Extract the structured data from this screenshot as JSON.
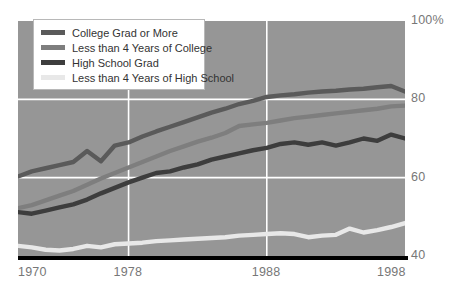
{
  "chart_data": {
    "type": "line",
    "title": "",
    "subtitle": "",
    "xlabel": "",
    "ylabel": "",
    "xlim": [
      1970,
      1998
    ],
    "ylim": [
      40,
      100
    ],
    "grid": true,
    "grid_y": [
      80,
      60
    ],
    "grid_x": [
      1978,
      1988
    ],
    "legend_position": "top-left",
    "background_color": "#969696",
    "x": [
      1970,
      1971,
      1972,
      1973,
      1974,
      1975,
      1976,
      1977,
      1978,
      1979,
      1980,
      1981,
      1982,
      1983,
      1984,
      1985,
      1986,
      1987,
      1988,
      1989,
      1990,
      1991,
      1992,
      1993,
      1994,
      1995,
      1996,
      1997,
      1998
    ],
    "series": [
      {
        "name": "College Grad or More",
        "color": "#5a5a5a",
        "values": [
          60.3,
          61.6,
          62.4,
          63.2,
          64.0,
          66.8,
          64.2,
          68.2,
          69.0,
          70.5,
          71.8,
          73.0,
          74.2,
          75.4,
          76.6,
          77.6,
          78.8,
          79.6,
          80.6,
          81.0,
          81.3,
          81.7,
          82.0,
          82.2,
          82.5,
          82.7,
          83.1,
          83.4,
          82.0
        ]
      },
      {
        "name": "Less than 4 Years of College",
        "color": "#7e7e7e",
        "values": [
          52.2,
          53.0,
          54.2,
          55.4,
          56.6,
          58.2,
          59.8,
          61.2,
          62.6,
          64.0,
          65.4,
          66.8,
          68.0,
          69.2,
          70.2,
          71.4,
          73.2,
          73.6,
          74.0,
          74.6,
          75.2,
          75.6,
          76.0,
          76.4,
          76.8,
          77.2,
          77.6,
          78.2,
          78.4
        ]
      },
      {
        "name": "High School Grad",
        "color": "#3d3d3d",
        "values": [
          51.2,
          50.8,
          51.6,
          52.4,
          53.2,
          54.4,
          56.0,
          57.4,
          58.8,
          60.0,
          61.2,
          61.6,
          62.6,
          63.4,
          64.6,
          65.4,
          66.2,
          67.0,
          67.6,
          68.6,
          69.0,
          68.4,
          69.0,
          68.2,
          69.0,
          70.0,
          69.4,
          71.0,
          70.0
        ]
      },
      {
        "name": "Less than 4 Years of High School",
        "color": "#e8e8e8",
        "values": [
          42.6,
          42.2,
          41.6,
          41.4,
          41.8,
          42.6,
          42.2,
          43.0,
          43.2,
          43.4,
          43.8,
          44.0,
          44.2,
          44.4,
          44.6,
          44.8,
          45.2,
          45.4,
          45.6,
          45.8,
          45.6,
          44.8,
          45.2,
          45.4,
          47.0,
          46.0,
          46.6,
          47.4,
          48.4
        ]
      }
    ],
    "y_ticks": [
      {
        "label": "100%",
        "value": 100
      },
      {
        "label": "80",
        "value": 80
      },
      {
        "label": "60",
        "value": 60
      },
      {
        "label": "40",
        "value": 40
      }
    ],
    "x_ticks": [
      {
        "label": "1970",
        "value": 1970
      },
      {
        "label": "1978",
        "value": 1978
      },
      {
        "label": "1988",
        "value": 1988
      },
      {
        "label": "1998",
        "value": 1998
      }
    ],
    "legend": [
      {
        "label": "College Grad or More",
        "color": "#5a5a5a"
      },
      {
        "label": "Less than 4 Years of College",
        "color": "#7e7e7e"
      },
      {
        "label": "High School Grad",
        "color": "#3d3d3d"
      },
      {
        "label": "Less than 4 Years of High School",
        "color": "#e8e8e8"
      }
    ]
  }
}
